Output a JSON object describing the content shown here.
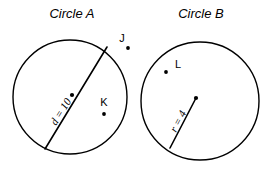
{
  "figure": {
    "background_color": "#ffffff",
    "stroke_color": "#000000",
    "circles": [
      {
        "id": "circle-a",
        "title": "Circle A",
        "title_x": 72,
        "title_y": 18,
        "cx": 70,
        "cy": 97,
        "r": 57,
        "center_dot_x": 72,
        "center_dot_y": 95,
        "segment": {
          "kind": "diameter",
          "label": "d = 10",
          "x1": 45,
          "y1": 149,
          "x2": 107,
          "y2": 47,
          "label_x": 56,
          "label_y": 126,
          "label_rotation": -58
        },
        "points": [
          {
            "id": "point-k",
            "label": "K",
            "dot_x": 104,
            "dot_y": 114,
            "label_x": 104,
            "label_y": 106
          }
        ]
      },
      {
        "id": "circle-b",
        "title": "Circle B",
        "title_x": 201,
        "title_y": 18,
        "cx": 200,
        "cy": 101,
        "r": 59,
        "center_dot_x": 196,
        "center_dot_y": 98,
        "segment": {
          "kind": "radius",
          "label": "r = 4",
          "x1": 170,
          "y1": 148,
          "x2": 196,
          "y2": 98,
          "label_x": 176,
          "label_y": 133,
          "label_rotation": -62
        },
        "points": [
          {
            "id": "point-l",
            "label": "L",
            "dot_x": 166,
            "dot_y": 72,
            "label_x": 178,
            "label_y": 68
          }
        ]
      }
    ],
    "free_points": [
      {
        "id": "point-j",
        "label": "J",
        "dot_x": 128,
        "dot_y": 48,
        "label_x": 122,
        "label_y": 42
      }
    ]
  }
}
